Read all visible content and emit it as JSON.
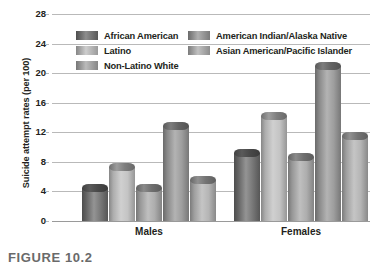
{
  "chart_data": {
    "type": "bar",
    "title": "",
    "xlabel": "",
    "ylabel": "Suicide attempt rates (per 100)",
    "categories": [
      "Males",
      "Females"
    ],
    "ylim": [
      0,
      28
    ],
    "yticks": [
      0,
      4,
      8,
      12,
      16,
      20,
      24,
      28
    ],
    "ytick_labels": [
      "0",
      "4",
      "8",
      "12",
      "16",
      "20",
      "24",
      "28"
    ],
    "grid": true,
    "legend_position": "top-center",
    "series": [
      {
        "name": "African American",
        "color": "#6e6e6e",
        "values": [
          5.0,
          9.7
        ]
      },
      {
        "name": "Latino",
        "color": "#c0c0c0",
        "values": [
          7.8,
          14.7
        ]
      },
      {
        "name": "Non-Latino White",
        "color": "#a8a8a8",
        "values": [
          5.0,
          9.2
        ]
      },
      {
        "name": "American Indian/Alaska Native",
        "color": "#989898",
        "values": [
          13.4,
          21.5
        ]
      },
      {
        "name": "Asian American/Pacific Islander",
        "color": "#b0b0b0",
        "values": [
          6.1,
          12.1
        ]
      }
    ]
  },
  "legend": {
    "items": [
      {
        "label": "African American"
      },
      {
        "label": "American Indian/Alaska Native"
      },
      {
        "label": "Latino"
      },
      {
        "label": "Asian American/Pacific Islander"
      },
      {
        "label": "Non-Latino White"
      }
    ]
  },
  "caption": {
    "text": "FIGURE 10.2"
  }
}
